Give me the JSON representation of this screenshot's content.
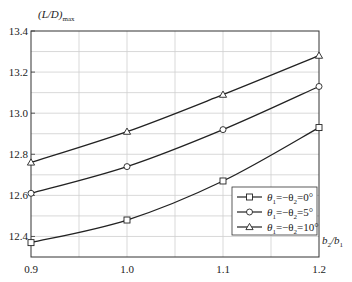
{
  "chart_data": {
    "type": "line",
    "title": "",
    "xlabel": "b2/b1",
    "ylabel": "(L/D)max",
    "x": [
      0.9,
      1.0,
      1.1,
      1.2
    ],
    "xlim": [
      0.9,
      1.2
    ],
    "ylim": [
      12.3,
      13.4
    ],
    "xticks": [
      0.9,
      1.0,
      1.1,
      1.2
    ],
    "yticks": [
      12.4,
      12.6,
      12.8,
      13.0,
      13.2,
      13.4
    ],
    "grid": true,
    "legend_position": "lower right",
    "series": [
      {
        "name": "θ1=−θ2=0°",
        "marker": "square",
        "values": [
          12.37,
          12.48,
          12.67,
          12.93
        ]
      },
      {
        "name": "θ1=−θ2=5°",
        "marker": "circle",
        "values": [
          12.61,
          12.74,
          12.92,
          13.13
        ]
      },
      {
        "name": "θ1=−θ2=10°",
        "marker": "triangle",
        "values": [
          12.76,
          12.91,
          13.09,
          13.28
        ]
      }
    ]
  },
  "axes": {
    "ylabel_main": "(L/D)",
    "ylabel_sub": "max",
    "xlabel_b2": "b",
    "xlabel_sub2": "2",
    "xlabel_slash": "/b",
    "xlabel_sub1": "1",
    "xtick_labels": [
      "0.9",
      "1.0",
      "1.1",
      "1.2"
    ],
    "ytick_labels": [
      "12.4",
      "12.6",
      "12.8",
      "13.0",
      "13.2",
      "13.4"
    ]
  },
  "legend": {
    "items": [
      {
        "theta1": "θ",
        "s1": "1",
        "mid": "=−θ",
        "s2": "2",
        "val": "=0°"
      },
      {
        "theta1": "θ",
        "s1": "1",
        "mid": "=−θ",
        "s2": "2",
        "val": "=5°"
      },
      {
        "theta1": "θ",
        "s1": "1",
        "mid": "=−θ",
        "s2": "2",
        "val": "=10°"
      }
    ]
  }
}
